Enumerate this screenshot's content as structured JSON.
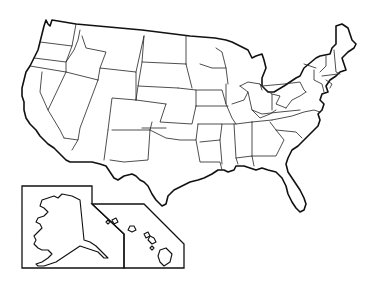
{
  "map": {
    "title": "",
    "type": "blank-outline-map",
    "region": "United States",
    "colors": {
      "stroke": "#111111",
      "fill": "#ffffff",
      "background": "#ffffff"
    },
    "mainland_outline": "M44,26 L46,20 L48,24 L50,26 L52,20 L76,24 L142,30 L190,36 L215,38 L226,40 L232,42 L240,46 L248,50 L252,58 L256,56 L262,54 L264,60 L266,68 L262,78 L262,86 L268,92 L274,92 L284,86 L296,78 L300,76 L304,68 L316,58 L320,56 L330,54 L332,48 L336,44 L336,26 L342,24 L348,28 L352,40 L356,44 L354,48 L348,52 L342,58 L344,64 L346,70 L340,72 L336,76 L330,80 L326,86 L328,92 L322,94 L320,100 L324,104 L322,110 L318,114 L320,120 L318,126 L314,130 L310,134 L306,138 L302,142 L298,146 L292,150 L290,154 L288,158 L286,164 L288,172 L292,178 L296,184 L300,190 L304,198 L306,204 L304,210 L300,212 L296,208 L292,202 L288,194 L286,186 L282,178 L276,172 L268,170 L262,168 L256,170 L250,168 L244,166 L236,166 L234,170 L228,172 L224,170 L218,170 L212,174 L208,176 L204,178 L198,180 L190,182 L182,186 L174,190 L168,196 L166,204 L162,206 L156,200 L152,194 L148,186 L144,182 L140,180 L136,176 L132,174 L124,176 L118,180 L114,178 L110,172 L106,166 L100,164 L92,162 L80,162 L70,162 L66,160 L60,154 L54,148 L48,144 L44,140 L40,136 L36,130 L30,124 L26,118 L24,110 L24,102 L22,96 L22,88 L24,80 L26,72 L30,66 L34,58 L38,50 L40,42 L42,34 Z",
    "state_borders": [
      "M40,42 L72,46 L76,24",
      "M34,58 L66,62 L72,46",
      "M30,66 L66,72 L98,80",
      "M66,72 L66,62 L74,50 L78,40 L80,30",
      "M66,72 L48,110 L60,130 L64,138",
      "M48,110 L40,92 L42,72",
      "M98,80 L80,128 L78,140 L64,138",
      "M78,140 L72,150",
      "M98,80 L100,68 L136,72 L136,100",
      "M100,68 L106,52 L86,48 L82,36",
      "M136,72 L144,36",
      "M136,100 L112,98 L108,130",
      "M108,130 L104,160",
      "M136,100 L166,104",
      "M144,36 L142,62 L186,64",
      "M142,62 L138,86 L178,88",
      "M138,86 L136,100",
      "M166,104 L160,122 L192,124 L196,106",
      "M112,130 L150,130 L152,122",
      "M150,130 L148,160 L124,162 L110,160",
      "M150,130 L166,138 L180,140 L196,140 L198,124",
      "M142,128 L166,128",
      "M178,88 L196,90 L196,106",
      "M186,64 L186,36",
      "M186,64 L192,88",
      "M196,90 L222,90 L226,104",
      "M196,106 L228,106",
      "M196,140 L200,162 L220,162 L222,170",
      "M198,124 L222,124 L220,140 L200,142",
      "M216,48 L222,52 L226,68 L228,84",
      "M226,68 L212,68 L200,64",
      "M226,84 L226,104 L232,118 L236,124",
      "M222,124 L236,124 L252,122",
      "M220,140 L222,164",
      "M234,124 L236,158 L238,164",
      "M236,158 L252,156 L254,166",
      "M252,122 L252,156",
      "M252,122 L272,120",
      "M252,156 L276,156 L280,148 L284,140 L276,130 L270,122",
      "M232,104 L244,100 L248,92 L240,86",
      "M240,86 L248,82 L260,84 L262,90",
      "M248,92 L252,110 L260,118 L270,114 L276,110",
      "M260,84 L266,90 L272,94 L272,110",
      "M272,94 L280,96 L276,104 L286,108",
      "M286,108 L292,100 L300,96 L306,92",
      "M262,86 L284,84 L300,82 L304,90 L306,92",
      "M272,120 L292,116 L304,112 L314,110 L320,112",
      "M252,110 L262,114 L280,112 L300,110",
      "M276,130 L296,132 L302,138",
      "M304,64 L316,68",
      "M326,56 L326,66 L320,72",
      "M334,50 L336,72 L340,74",
      "M322,76 L338,74",
      "M326,80 L332,84 L330,88",
      "M314,70 L314,80 L322,84 L324,92"
    ],
    "insets": {
      "alaska": {
        "frame": "M22,186 L92,186 L92,204 L124,234 L124,268 L22,268 Z",
        "shape": "M58,198 L62,194 L72,196 L80,200 L84,240 L90,242 L96,246 L100,250 L104,254 L108,258 L104,258 L98,252 L92,250 L86,248 L80,246 L74,250 L68,254 L62,258 L56,262 L50,264 L44,266 L38,266 L36,264 L42,262 L48,258 L52,254 L48,250 L42,250 L38,248 L34,244 L36,240 L34,236 L38,232 L42,228 L40,224 L36,222 L38,218 L44,216 L48,212 L44,208 L40,206 L42,200 L48,198 L54,196 Z"
      },
      "hawaii": {
        "frame": "M92,204 L144,204 L184,244 L184,268 L124,268 L124,234 Z",
        "islands": [
          "M106,222 L108,220 L110,222 L108,224 Z",
          "M112,220 L116,218 L118,222 L114,224 Z",
          "M130,226 L134,226 L136,230 L132,232 L128,230 Z",
          "M144,234 L148,232 L150,236 L146,238 Z",
          "M150,236 L154,238 L156,242 L152,244 L148,240 Z",
          "M152,246 L154,248 L152,250 L150,248 Z",
          "M160,250 L166,248 L172,254 L170,262 L164,266 L160,262 L158,256 Z"
        ]
      }
    }
  }
}
